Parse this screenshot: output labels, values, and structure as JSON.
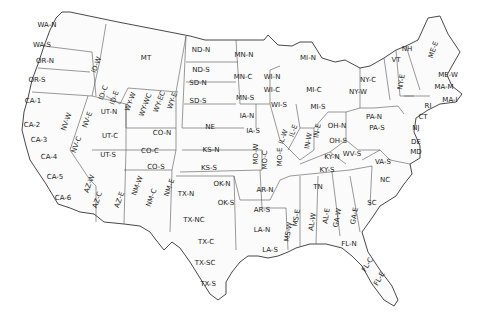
{
  "map": {
    "title": "US Climate Divisions / Utility Zones",
    "regions": [
      {
        "id": "WA-N",
        "x": 47,
        "y": 25,
        "rot": 0
      },
      {
        "id": "WA-S",
        "x": 42,
        "y": 45,
        "rot": 0
      },
      {
        "id": "OR-N",
        "x": 45,
        "y": 61,
        "rot": 0
      },
      {
        "id": "OR-S",
        "x": 37,
        "y": 80,
        "rot": 0
      },
      {
        "id": "ID-W",
        "x": 97,
        "y": 65,
        "rot": -70
      },
      {
        "id": "ID-C",
        "x": 104,
        "y": 93,
        "rot": -70
      },
      {
        "id": "ID-E",
        "x": 115,
        "y": 98,
        "rot": -70
      },
      {
        "id": "MT",
        "x": 146,
        "y": 58,
        "rot": 0
      },
      {
        "id": "WY-W",
        "x": 131,
        "y": 102,
        "rot": -70
      },
      {
        "id": "WY-WC",
        "x": 146,
        "y": 105,
        "rot": -70
      },
      {
        "id": "WY-EC",
        "x": 160,
        "y": 102,
        "rot": -70
      },
      {
        "id": "WY-E",
        "x": 173,
        "y": 101,
        "rot": -70
      },
      {
        "id": "CA-1",
        "x": 33,
        "y": 101,
        "rot": 0
      },
      {
        "id": "CA-2",
        "x": 32,
        "y": 125,
        "rot": 0
      },
      {
        "id": "CA-3",
        "x": 39,
        "y": 140,
        "rot": 0
      },
      {
        "id": "CA-4",
        "x": 49,
        "y": 157,
        "rot": 0
      },
      {
        "id": "CA-5",
        "x": 55,
        "y": 177,
        "rot": 0
      },
      {
        "id": "CA-6",
        "x": 63,
        "y": 198,
        "rot": 0
      },
      {
        "id": "NV-W",
        "x": 67,
        "y": 122,
        "rot": -70
      },
      {
        "id": "NV-E",
        "x": 88,
        "y": 120,
        "rot": -70
      },
      {
        "id": "NV-C",
        "x": 77,
        "y": 145,
        "rot": -70
      },
      {
        "id": "UT-N",
        "x": 109,
        "y": 112,
        "rot": 0
      },
      {
        "id": "UT-C",
        "x": 110,
        "y": 136,
        "rot": 0
      },
      {
        "id": "UT-S",
        "x": 108,
        "y": 155,
        "rot": 0
      },
      {
        "id": "AZ-W",
        "x": 90,
        "y": 184,
        "rot": -70
      },
      {
        "id": "AZ-C",
        "x": 98,
        "y": 200,
        "rot": -70
      },
      {
        "id": "AZ-E",
        "x": 120,
        "y": 200,
        "rot": -70
      },
      {
        "id": "NM-W",
        "x": 138,
        "y": 186,
        "rot": -70
      },
      {
        "id": "NM-C",
        "x": 152,
        "y": 198,
        "rot": -70
      },
      {
        "id": "NM-E",
        "x": 170,
        "y": 188,
        "rot": -70
      },
      {
        "id": "CO-N",
        "x": 162,
        "y": 133,
        "rot": 0
      },
      {
        "id": "CO-C",
        "x": 150,
        "y": 151,
        "rot": 0
      },
      {
        "id": "CO-S",
        "x": 156,
        "y": 167,
        "rot": 0
      },
      {
        "id": "ND-N",
        "x": 201,
        "y": 50,
        "rot": 0
      },
      {
        "id": "ND-S",
        "x": 201,
        "y": 70,
        "rot": 0
      },
      {
        "id": "SD-N",
        "x": 198,
        "y": 83,
        "rot": 0
      },
      {
        "id": "SD-S",
        "x": 198,
        "y": 101,
        "rot": 0
      },
      {
        "id": "NE",
        "x": 210,
        "y": 127,
        "rot": 0
      },
      {
        "id": "KS-N",
        "x": 211,
        "y": 150,
        "rot": 0
      },
      {
        "id": "KS-S",
        "x": 209,
        "y": 168,
        "rot": 0
      },
      {
        "id": "OK-N",
        "x": 222,
        "y": 184,
        "rot": 0
      },
      {
        "id": "OK-S",
        "x": 226,
        "y": 203,
        "rot": 0
      },
      {
        "id": "TX-N",
        "x": 186,
        "y": 194,
        "rot": 0
      },
      {
        "id": "TX-NC",
        "x": 194,
        "y": 220,
        "rot": 0
      },
      {
        "id": "TX-C",
        "x": 206,
        "y": 242,
        "rot": 0
      },
      {
        "id": "TX-SC",
        "x": 205,
        "y": 263,
        "rot": 0
      },
      {
        "id": "TX-S",
        "x": 208,
        "y": 284,
        "rot": 0
      },
      {
        "id": "MN-N",
        "x": 244,
        "y": 55,
        "rot": 0
      },
      {
        "id": "MN-C",
        "x": 243,
        "y": 77,
        "rot": 0
      },
      {
        "id": "MN-S",
        "x": 245,
        "y": 98,
        "rot": 0
      },
      {
        "id": "WI-N",
        "x": 272,
        "y": 77,
        "rot": 0
      },
      {
        "id": "WI-C",
        "x": 272,
        "y": 90,
        "rot": 0
      },
      {
        "id": "WI-S",
        "x": 279,
        "y": 105,
        "rot": 0
      },
      {
        "id": "MI-N",
        "x": 308,
        "y": 58,
        "rot": 0
      },
      {
        "id": "MI-C",
        "x": 314,
        "y": 90,
        "rot": 0
      },
      {
        "id": "MI-S",
        "x": 318,
        "y": 107,
        "rot": 0
      },
      {
        "id": "IA-N",
        "x": 247,
        "y": 116,
        "rot": 0
      },
      {
        "id": "IA-S",
        "x": 253,
        "y": 131,
        "rot": 0
      },
      {
        "id": "MO-W",
        "x": 256,
        "y": 154,
        "rot": -90
      },
      {
        "id": "MO-C",
        "x": 265,
        "y": 160,
        "rot": -90
      },
      {
        "id": "MO-E",
        "x": 280,
        "y": 157,
        "rot": -90
      },
      {
        "id": "IL-W",
        "x": 284,
        "y": 137,
        "rot": -70
      },
      {
        "id": "IL-E",
        "x": 294,
        "y": 131,
        "rot": -70
      },
      {
        "id": "IN-W",
        "x": 309,
        "y": 141,
        "rot": -80
      },
      {
        "id": "IN-E",
        "x": 318,
        "y": 131,
        "rot": -80
      },
      {
        "id": "OH-N",
        "x": 337,
        "y": 126,
        "rot": 0
      },
      {
        "id": "OH-S",
        "x": 338,
        "y": 141,
        "rot": 0
      },
      {
        "id": "KY-N",
        "x": 332,
        "y": 157,
        "rot": 0
      },
      {
        "id": "KY-S",
        "x": 327,
        "y": 170,
        "rot": 0
      },
      {
        "id": "TN",
        "x": 318,
        "y": 187,
        "rot": 0
      },
      {
        "id": "AR-N",
        "x": 265,
        "y": 190,
        "rot": 0
      },
      {
        "id": "AR-S",
        "x": 262,
        "y": 210,
        "rot": 0
      },
      {
        "id": "LA-N",
        "x": 262,
        "y": 230,
        "rot": 0
      },
      {
        "id": "LA-S",
        "x": 270,
        "y": 250,
        "rot": 0
      },
      {
        "id": "MS-W",
        "x": 289,
        "y": 232,
        "rot": -80
      },
      {
        "id": "MS-E",
        "x": 297,
        "y": 218,
        "rot": -80
      },
      {
        "id": "AL-W",
        "x": 313,
        "y": 222,
        "rot": -80
      },
      {
        "id": "AL-E",
        "x": 327,
        "y": 216,
        "rot": -80
      },
      {
        "id": "GA-W",
        "x": 338,
        "y": 218,
        "rot": -80
      },
      {
        "id": "GA-E",
        "x": 355,
        "y": 216,
        "rot": -80
      },
      {
        "id": "FL-N",
        "x": 349,
        "y": 244,
        "rot": 0
      },
      {
        "id": "FL-C",
        "x": 368,
        "y": 265,
        "rot": -60
      },
      {
        "id": "FL-E",
        "x": 380,
        "y": 279,
        "rot": -60
      },
      {
        "id": "SC",
        "x": 372,
        "y": 203,
        "rot": 0
      },
      {
        "id": "NC",
        "x": 385,
        "y": 180,
        "rot": 0
      },
      {
        "id": "VA-S",
        "x": 383,
        "y": 162,
        "rot": 0
      },
      {
        "id": "WV-S",
        "x": 352,
        "y": 154,
        "rot": 0
      },
      {
        "id": "PA-N",
        "x": 374,
        "y": 117,
        "rot": 0
      },
      {
        "id": "PA-S",
        "x": 377,
        "y": 128,
        "rot": 0
      },
      {
        "id": "NY-W",
        "x": 358,
        "y": 92,
        "rot": 0
      },
      {
        "id": "NY-C",
        "x": 368,
        "y": 80,
        "rot": 0
      },
      {
        "id": "NY-E",
        "x": 402,
        "y": 82,
        "rot": -80
      },
      {
        "id": "VT",
        "x": 396,
        "y": 60,
        "rot": 0
      },
      {
        "id": "NH",
        "x": 407,
        "y": 49,
        "rot": 0
      },
      {
        "id": "ME-E",
        "x": 434,
        "y": 50,
        "rot": -70
      },
      {
        "id": "ME-W",
        "x": 448,
        "y": 75,
        "rot": 0
      },
      {
        "id": "MA-M",
        "x": 444,
        "y": 87,
        "rot": 0
      },
      {
        "id": "MA-I",
        "x": 450,
        "y": 100,
        "rot": 0
      },
      {
        "id": "RI",
        "x": 428,
        "y": 106,
        "rot": 0
      },
      {
        "id": "CT",
        "x": 423,
        "y": 117,
        "rot": 0
      },
      {
        "id": "NJ",
        "x": 416,
        "y": 128,
        "rot": 0
      },
      {
        "id": "DE",
        "x": 416,
        "y": 142,
        "rot": 0
      },
      {
        "id": "MD",
        "x": 416,
        "y": 152,
        "rot": 0
      }
    ]
  }
}
